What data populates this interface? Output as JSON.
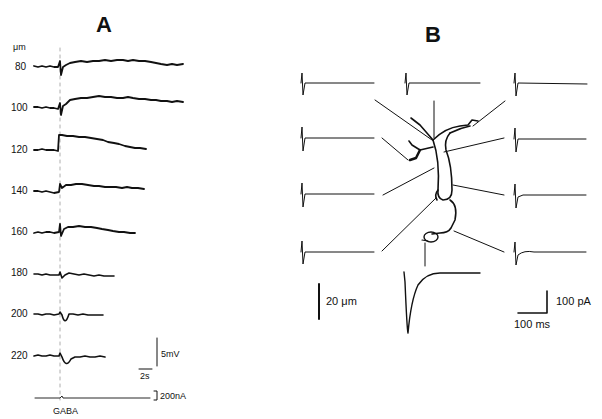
{
  "figure": {
    "panel_a": {
      "label": "A",
      "unit_label": "μm",
      "depths": [
        "80",
        "100",
        "120",
        "140",
        "160",
        "180",
        "200",
        "220"
      ],
      "scale_bar_voltage": "5mV",
      "scale_bar_time": "2s",
      "scale_bar_current": "200nA",
      "stimulus_label": "GABA"
    },
    "panel_b": {
      "label": "B",
      "scale_bar_length": "20 μm",
      "scale_bar_current": "100 pA",
      "scale_bar_time": "100 ms"
    }
  }
}
